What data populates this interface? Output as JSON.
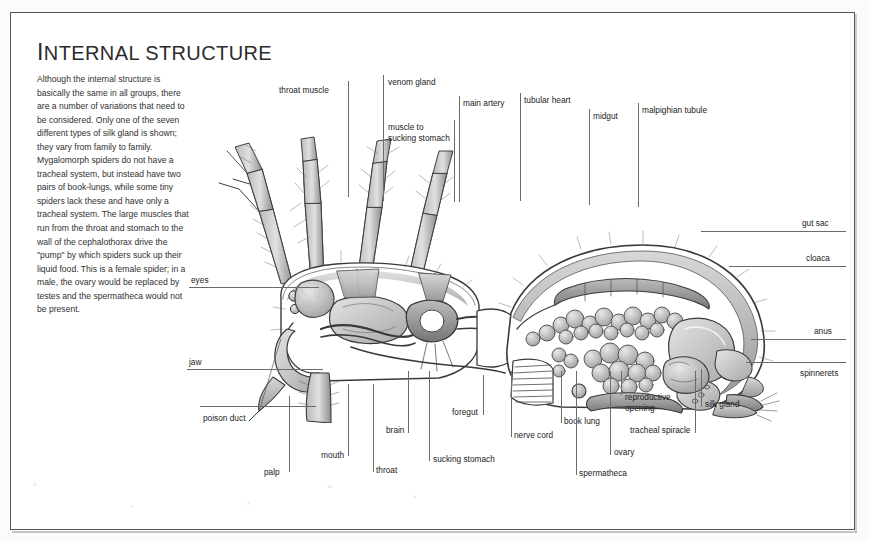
{
  "page": {
    "title_first_letter": "I",
    "title_rest": "NTERNAL STRUCTURE",
    "title_full": "INTERNAL STRUCTURE",
    "body_text": "Although the internal structure is basically the same in all groups, there are a number of variations that need to be considered. Only one of the seven different types of silk gland is shown; they vary from family to family. Mygalomorph spiders do not have a tracheal system, but instead have two pairs of book-lungs, while some tiny spiders lack these and have only a tracheal system. The large muscles that run from the throat and stomach to the wall of the cephalothorax drive the \"pump\" by which spiders suck up their liquid food. This is a female spider; in a male, the ovary would be replaced by testes and the spermatheca would not be present."
  },
  "colors": {
    "page_background": "#f2f2f0",
    "sheet": "#ffffff",
    "border": "#555555",
    "text": "#303030",
    "leader_line": "#6b6b6b",
    "art_dark": "#4a4a4a",
    "art_mid": "#8d8d8d",
    "art_light": "#c9c9c9"
  },
  "labels": {
    "throat_muscle": "throat muscle",
    "venom_gland": "venom gland",
    "muscle_to_sucking_stomach": "muscle to sucking stomach",
    "main_artery": "main artery",
    "tubular_heart": "tubular heart",
    "midgut": "midgut",
    "malpighian_tubule": "malpighian tubule",
    "gut_sac": "gut sac",
    "cloaca": "cloaca",
    "anus": "anus",
    "spinnerets": "spinnerets",
    "silk_gland": "silk gland",
    "tracheal_spiracle": "tracheal spiracle",
    "reproductive_opening": "reproductive opening",
    "ovary": "ovary",
    "spermatheca": "spermatheca",
    "book_lung": "book lung",
    "nerve_cord": "nerve cord",
    "sucking_stomach": "sucking stomach",
    "foregut": "foregut",
    "brain": "brain",
    "throat": "throat",
    "mouth": "mouth",
    "palp": "palp",
    "poison_duct": "poison duct",
    "jaw": "jaw",
    "eyes": "eyes"
  },
  "illustration": {
    "subject": "spider-internal-anatomy-cutaway",
    "view": "lateral section of a female spider"
  }
}
